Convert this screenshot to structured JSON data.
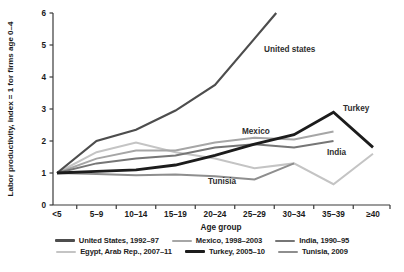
{
  "chart_data": {
    "type": "line",
    "title": "",
    "xlabel": "Age group",
    "ylabel": "Labor productivity, index = 1 for firms age 0–4",
    "ylim": [
      0,
      6
    ],
    "yticks": [
      0,
      1,
      2,
      3,
      4,
      5,
      6
    ],
    "categories": [
      "<5",
      "5–9",
      "10–14",
      "15–19",
      "20–24",
      "25–29",
      "30–34",
      "35–39",
      "≥40"
    ],
    "grid": false,
    "legend_position": "bottom",
    "axis_color": "#3a3a3a",
    "series": [
      {
        "name": "United States, 1992–97",
        "color": "#4d4d4d",
        "width": 2.2,
        "values": [
          1,
          2.0,
          2.35,
          2.95,
          3.75,
          5.2,
          null,
          null,
          null
        ],
        "clip_point": {
          "x_index": 5.55,
          "value": 6
        },
        "note": "line rises past axis maximum; clipped at 6 between 25–29 and 30–34"
      },
      {
        "name": "Mexico, 1998–2003",
        "color": "#a6a6a6",
        "width": 2,
        "values": [
          1,
          1.45,
          1.7,
          1.7,
          1.95,
          2.1,
          2.05,
          2.3,
          null
        ]
      },
      {
        "name": "India, 1990–95",
        "color": "#767676",
        "width": 2,
        "values": [
          1,
          1.3,
          1.45,
          1.55,
          1.8,
          1.9,
          1.8,
          2.0,
          null
        ]
      },
      {
        "name": "Egypt, Arab Rep., 2007–11",
        "color": "#c4c4c4",
        "width": 2,
        "values": [
          1,
          1.65,
          1.95,
          1.65,
          1.45,
          1.15,
          1.3,
          0.65,
          1.6
        ]
      },
      {
        "name": "Turkey, 2005–10",
        "color": "#1c1c1c",
        "width": 2.8,
        "values": [
          1,
          1.05,
          1.1,
          1.25,
          1.55,
          1.9,
          2.2,
          2.9,
          1.8
        ]
      },
      {
        "name": "Tunisia, 2009",
        "color": "#8e8e8e",
        "width": 2,
        "values": [
          1,
          0.97,
          0.93,
          0.95,
          0.9,
          0.8,
          1.3,
          null,
          null
        ]
      }
    ],
    "annotations": [
      {
        "text": "United states",
        "x": 264,
        "y": 52
      },
      {
        "text": "Turkey",
        "x": 343,
        "y": 111
      },
      {
        "text": "Mexico",
        "x": 242,
        "y": 134
      },
      {
        "text": "India",
        "x": 327,
        "y": 155
      },
      {
        "text": "Tunisia",
        "x": 208,
        "y": 184
      }
    ]
  },
  "legend": {
    "rows": [
      [
        0,
        1,
        2
      ],
      [
        3,
        4,
        5
      ]
    ]
  }
}
